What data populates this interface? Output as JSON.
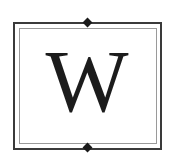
{
  "logo": {
    "letter": "W",
    "colors": {
      "letter": "#1c1c1c",
      "outer_frame": "#3a3a3a",
      "inner_frame": "#9a9a9a",
      "ornament": "#1a1a1a",
      "background": "#ffffff"
    },
    "ornaments": [
      "diamond-top",
      "diamond-bottom"
    ]
  }
}
